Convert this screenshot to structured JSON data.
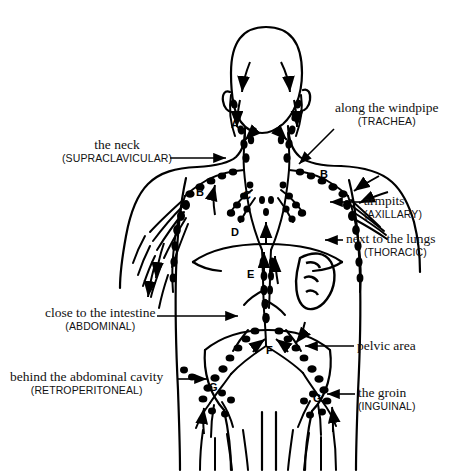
{
  "figure": {
    "ink_color": "#000000",
    "background_color": "#ffffff"
  },
  "callouts": [
    {
      "id": "supraclavicular",
      "primary": "the neck",
      "secondary": "(SUPRACLAVICULAR)",
      "align": "center",
      "text_x": 62,
      "text_y": 138,
      "leader": {
        "x1": 170,
        "y1": 158,
        "x2": 232,
        "y2": 158,
        "arrow": "right"
      }
    },
    {
      "id": "trachea",
      "primary": "along the windpipe",
      "secondary": "(TRACHEA)",
      "align": "left",
      "text_x": 335,
      "text_y": 101,
      "leader": {
        "x1": 334,
        "y1": 129,
        "x2": 296,
        "y2": 167,
        "arrow": "down-left"
      }
    },
    {
      "id": "axillary",
      "primary": "armpits",
      "secondary": "(AXILLARY)",
      "align": "left",
      "text_x": 364,
      "text_y": 194,
      "leader": {
        "x1": 360,
        "y1": 202,
        "x2": 325,
        "y2": 202,
        "arrow": "left"
      }
    },
    {
      "id": "thoracic",
      "primary": "next to the lungs",
      "secondary": "(THORACIC)",
      "align": "left",
      "text_x": 346,
      "text_y": 232,
      "leader": {
        "x1": 343,
        "y1": 240,
        "x2": 321,
        "y2": 240,
        "arrow": "left"
      }
    },
    {
      "id": "abdominal",
      "primary": "close to the intestine",
      "secondary": "(ABDOMINAL)",
      "align": "center",
      "text_x": 45,
      "text_y": 306,
      "leader": {
        "x1": 157,
        "y1": 316,
        "x2": 243,
        "y2": 316,
        "arrow": "right"
      }
    },
    {
      "id": "pelvic",
      "primary": "pelvic area",
      "secondary": "",
      "align": "left",
      "text_x": 357,
      "text_y": 339,
      "leader": {
        "x1": 354,
        "y1": 346,
        "x2": 300,
        "y2": 346,
        "arrow": "left"
      }
    },
    {
      "id": "retroperitoneal",
      "primary": "behind the abdominal cavity",
      "secondary": "(RETROPERITONEAL)",
      "align": "center",
      "text_x": 10,
      "text_y": 370,
      "leader": {
        "x1": 178,
        "y1": 379,
        "x2": 212,
        "y2": 379,
        "arrow": "right"
      }
    },
    {
      "id": "inguinal",
      "primary": "the groin",
      "secondary": "(INGUINAL)",
      "align": "left",
      "text_x": 358,
      "text_y": 386,
      "leader": {
        "x1": 355,
        "y1": 394,
        "x2": 322,
        "y2": 394,
        "arrow": "left"
      }
    }
  ],
  "markers": [
    {
      "label": "A",
      "x": 231,
      "y": 118
    },
    {
      "label": "B",
      "x": 196,
      "y": 186
    },
    {
      "label": "B",
      "x": 320,
      "y": 168
    },
    {
      "label": "C",
      "x": 243,
      "y": 189
    },
    {
      "label": "D",
      "x": 231,
      "y": 226
    },
    {
      "label": "E",
      "x": 247,
      "y": 268
    },
    {
      "label": "F",
      "x": 266,
      "y": 344
    },
    {
      "label": "G",
      "x": 209,
      "y": 381
    },
    {
      "label": "G",
      "x": 313,
      "y": 392
    }
  ]
}
